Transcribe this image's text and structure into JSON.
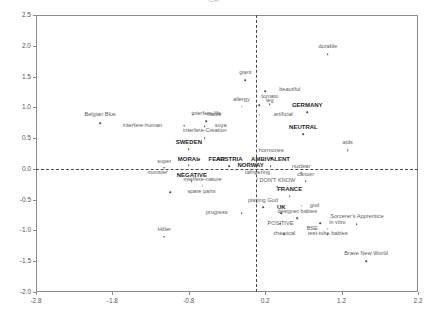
{
  "chart_data": {
    "type": "scatter",
    "title": "CA",
    "xlabel": "",
    "ylabel": "",
    "xlim": [
      -2.8,
      2.2
    ],
    "ylim": [
      -2.0,
      2.5
    ],
    "xticks": [
      "-2.8",
      "-1.8",
      "-0.8",
      "0.2",
      "1.2",
      "2.2"
    ],
    "xtick_values": [
      -2.8,
      -1.8,
      -0.8,
      0.2,
      1.2,
      2.2
    ],
    "yticks": [
      "2.5",
      "2.0",
      "1.5",
      "1.0",
      "0.5",
      "0.0",
      "-0.5",
      "-1.0",
      "-1.5",
      "-2.0"
    ],
    "ytick_values": [
      2.5,
      2.0,
      1.5,
      1.0,
      0.5,
      0.0,
      -0.5,
      -1.0,
      -1.5,
      -2.0
    ],
    "grid": false,
    "legend": "none",
    "reference_lines": {
      "vertical_x": 0.08,
      "horizontal_y": 0.0,
      "style": "dashed"
    },
    "points": [
      {
        "label": "Belgian Blue",
        "x": -1.96,
        "y": 0.74,
        "bold": false,
        "label_dx": 0,
        "label_dy": -8
      },
      {
        "label": "interfere-human",
        "x": -0.86,
        "y": 0.7,
        "bold": false,
        "label_dx": -22,
        "label_dy": 0
      },
      {
        "label": "maize",
        "x": -0.74,
        "y": 0.88,
        "bold": false,
        "label_dx": 13,
        "label_dy": 0
      },
      {
        "label": "interfere-life",
        "x": -0.57,
        "y": 0.77,
        "bold": false,
        "label_dx": 0,
        "label_dy": -7
      },
      {
        "label": "soya",
        "x": -0.59,
        "y": 0.69,
        "bold": false,
        "label_dx": 10,
        "label_dy": 0
      },
      {
        "label": "interfere-Creation",
        "x": -0.59,
        "y": 0.5,
        "bold": false,
        "label_dx": 0,
        "label_dy": -7
      },
      {
        "label": "SWEDEN",
        "x": -0.8,
        "y": 0.32,
        "bold": true,
        "label_dx": 0,
        "label_dy": -7
      },
      {
        "label": "FEAR",
        "x": -0.66,
        "y": 0.16,
        "bold": true,
        "label_dx": 9,
        "label_dy": 0
      },
      {
        "label": "MORAL",
        "x": -0.8,
        "y": 0.06,
        "bold": true,
        "label_dx": 0,
        "label_dy": -6
      },
      {
        "label": "super",
        "x": -1.12,
        "y": 0.02,
        "bold": false,
        "label_dx": 0,
        "label_dy": -6
      },
      {
        "label": "monster",
        "x": -0.88,
        "y": -0.06,
        "bold": false,
        "label_dx": -15,
        "label_dy": 0
      },
      {
        "label": "NEGATIVE",
        "x": -0.76,
        "y": -0.2,
        "bold": true,
        "label_dx": 0,
        "label_dy": -6
      },
      {
        "label": "interfere-nature",
        "x": -0.62,
        "y": -0.27,
        "bold": false,
        "label_dx": 0,
        "label_dy": -6
      },
      {
        "label": "spare parts",
        "x": -1.04,
        "y": -0.38,
        "bold": false,
        "label_dx": 17,
        "label_dy": 0
      },
      {
        "label": "Hitler",
        "x": -1.12,
        "y": -1.1,
        "bold": false,
        "label_dx": 0,
        "label_dy": -7
      },
      {
        "label": "giant",
        "x": -0.06,
        "y": 1.44,
        "bold": false,
        "label_dx": 0,
        "label_dy": -7
      },
      {
        "label": "beautiful",
        "x": 0.2,
        "y": 1.26,
        "bold": false,
        "label_dx": 14,
        "label_dy": -1
      },
      {
        "label": "allergy",
        "x": -0.11,
        "y": 1.01,
        "bold": false,
        "label_dx": 0,
        "label_dy": -7
      },
      {
        "label": "leg",
        "x": 0.12,
        "y": 1.03,
        "bold": false,
        "label_dx": 7,
        "label_dy": -4
      },
      {
        "label": "tomato",
        "x": 0.26,
        "y": 1.05,
        "bold": false,
        "label_dx": 0,
        "label_dy": -7
      },
      {
        "label": "artificial",
        "x": 0.13,
        "y": 0.88,
        "bold": false,
        "label_dx": 14,
        "label_dy": 0
      },
      {
        "label": "durable",
        "x": 1.02,
        "y": 1.86,
        "bold": false,
        "label_dx": 0,
        "label_dy": -7
      },
      {
        "label": "GERMANY",
        "x": 0.75,
        "y": 0.92,
        "bold": true,
        "label_dx": 0,
        "label_dy": -7
      },
      {
        "label": "NEUTRAL",
        "x": 0.7,
        "y": 0.56,
        "bold": true,
        "label_dx": 0,
        "label_dy": -7
      },
      {
        "label": "aids",
        "x": 1.28,
        "y": 0.3,
        "bold": false,
        "label_dx": 0,
        "label_dy": -7
      },
      {
        "label": "hormones",
        "x": 0.28,
        "y": 0.17,
        "bold": false,
        "label_dx": 0,
        "label_dy": -7
      },
      {
        "label": "AUSTRIA",
        "x": -0.27,
        "y": 0.04,
        "bold": true,
        "label_dx": 0,
        "label_dy": -7
      },
      {
        "label": "AMBIVALENT",
        "x": 0.27,
        "y": 0.04,
        "bold": true,
        "label_dx": 0,
        "label_dy": -7
      },
      {
        "label": "NORWAY",
        "x": 0.01,
        "y": -0.03,
        "bold": true,
        "label_dx": 0,
        "label_dy": -6
      },
      {
        "label": "tampering",
        "x": 0.1,
        "y": -0.16,
        "bold": false,
        "label_dx": 0,
        "label_dy": -6
      },
      {
        "label": "nuclear",
        "x": 0.67,
        "y": -0.06,
        "bold": false,
        "label_dx": 0,
        "label_dy": -6
      },
      {
        "label": "cancer",
        "x": 0.73,
        "y": -0.2,
        "bold": false,
        "label_dx": 0,
        "label_dy": -6
      },
      {
        "label": "DON'T KNOW",
        "x": 0.36,
        "y": -0.29,
        "bold": false,
        "label_dx": 0,
        "label_dy": -6
      },
      {
        "label": "FRANCE",
        "x": 0.52,
        "y": -0.44,
        "bold": true,
        "label_dx": 0,
        "label_dy": -7
      },
      {
        "label": "playing God",
        "x": 0.17,
        "y": -0.62,
        "bold": false,
        "label_dx": 0,
        "label_dy": -6
      },
      {
        "label": "god",
        "x": 0.68,
        "y": -0.6,
        "bold": false,
        "label_dx": 8,
        "label_dy": 0
      },
      {
        "label": "progress",
        "x": -0.11,
        "y": -0.72,
        "bold": false,
        "label_dx": -14,
        "label_dy": 0
      },
      {
        "label": "UK",
        "x": 0.41,
        "y": -0.72,
        "bold": true,
        "label_dx": 0,
        "label_dy": -6
      },
      {
        "label": "designer babies",
        "x": 0.62,
        "y": -0.8,
        "bold": false,
        "label_dx": 0,
        "label_dy": -6
      },
      {
        "label": "POSITIVE",
        "x": 0.4,
        "y": -0.89,
        "bold": false,
        "label_dx": 0,
        "label_dy": 0
      },
      {
        "label": "in vitro",
        "x": 0.92,
        "y": -0.88,
        "bold": false,
        "label_dx": 9,
        "label_dy": 0
      },
      {
        "label": "BSE",
        "x": 1.02,
        "y": -0.97,
        "bold": false,
        "label_dx": -10,
        "label_dy": 0
      },
      {
        "label": "chemical",
        "x": 0.45,
        "y": -1.06,
        "bold": false,
        "label_dx": 0,
        "label_dy": 0
      },
      {
        "label": "test-tube babies",
        "x": 1.02,
        "y": -1.06,
        "bold": false,
        "label_dx": 0,
        "label_dy": 0
      },
      {
        "label": "Sorcerer's Apprentice",
        "x": 1.4,
        "y": -0.9,
        "bold": false,
        "label_dx": 0,
        "label_dy": -7
      },
      {
        "label": "Brave New World",
        "x": 1.52,
        "y": -1.5,
        "bold": false,
        "label_dx": 0,
        "label_dy": -7
      }
    ]
  }
}
